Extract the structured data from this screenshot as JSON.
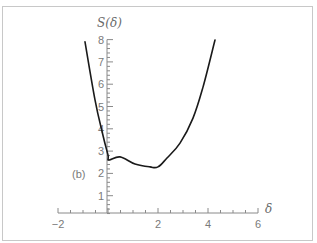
{
  "chart_data": {
    "type": "line",
    "title": "",
    "panel_label": "(b)",
    "xlabel": "δ",
    "ylabel": "S(δ)",
    "xlim": [
      -2,
      6
    ],
    "ylim": [
      0,
      8
    ],
    "x_ticks": [
      "-2",
      "2",
      "4",
      "6"
    ],
    "y_ticks": [
      "1",
      "2",
      "3",
      "4",
      "5",
      "6",
      "7",
      "8"
    ],
    "grid": false,
    "legend": null,
    "series": [
      {
        "name": "S(δ)",
        "x": [
          -0.92,
          -0.52,
          -0.2,
          0.0,
          0.04,
          0.48,
          1.08,
          1.68,
          2.0,
          2.36,
          2.88,
          3.4,
          3.8,
          4.28
        ],
        "y": [
          7.9,
          5.3,
          3.7,
          2.83,
          2.6,
          2.74,
          2.42,
          2.29,
          2.29,
          2.69,
          3.36,
          4.48,
          5.87,
          7.98
        ]
      }
    ]
  },
  "colors": {
    "curve": "#1a1a1a",
    "axis": "#8a8a8a",
    "text": "#7a7a7a",
    "border": "#c8c8c8"
  }
}
